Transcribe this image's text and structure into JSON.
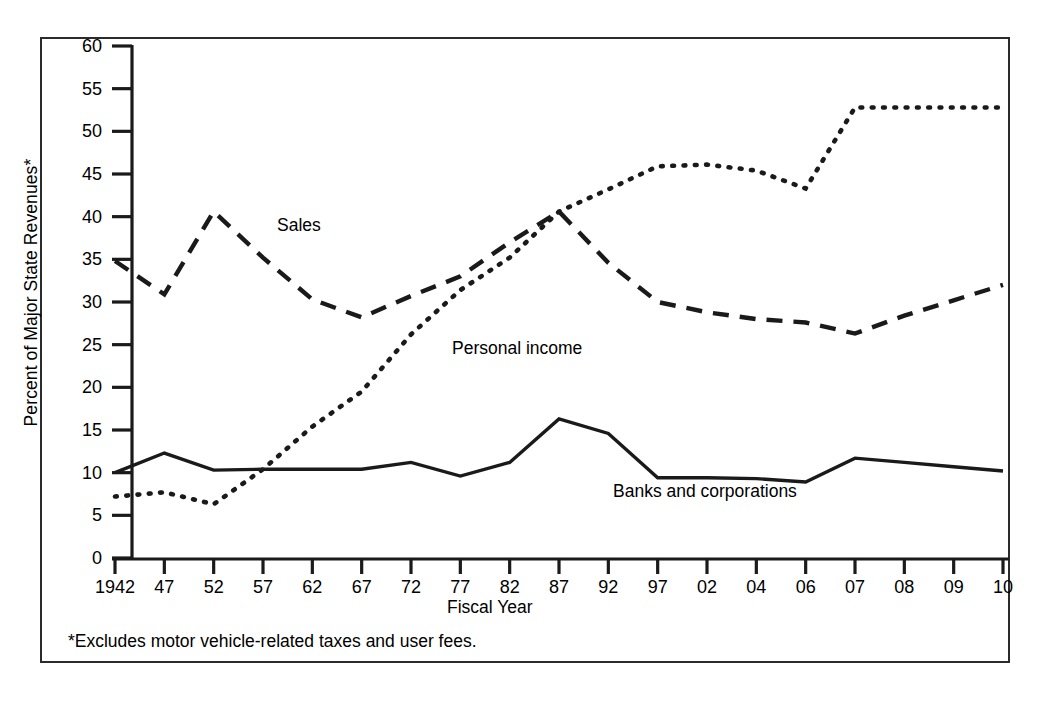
{
  "figure": {
    "y_axis_title": "Percent of Major State Revenues*",
    "x_axis_title": "Fiscal Year",
    "footnote": "*Excludes motor vehicle-related taxes and user fees.",
    "line_color": "#1a1a1a",
    "border_color": "#2b2b2b",
    "background": "#ffffff"
  },
  "chart_data": {
    "type": "line",
    "title": "",
    "xlabel": "Fiscal Year",
    "ylabel": "Percent of Major State Revenues*",
    "ylim": [
      0,
      60
    ],
    "yticks": [
      0,
      5,
      10,
      15,
      20,
      25,
      30,
      35,
      40,
      45,
      50,
      55,
      60
    ],
    "grid": false,
    "legend_position": "inline-annotations",
    "annotation": "*Excludes motor vehicle-related taxes and user fees.",
    "categories": [
      "1942",
      "47",
      "52",
      "57",
      "62",
      "67",
      "72",
      "77",
      "82",
      "87",
      "92",
      "97",
      "02",
      "04",
      "06",
      "07",
      "08",
      "09",
      "10"
    ],
    "series": [
      {
        "name": "Sales",
        "style": "dashed",
        "values": [
          34.8,
          30.9,
          40.6,
          35.2,
          30.3,
          28.2,
          30.7,
          33.0,
          37.0,
          40.6,
          34.6,
          30.0,
          28.8,
          28.0,
          27.6,
          26.3,
          28.4,
          30.2,
          32.0
        ]
      },
      {
        "name": "Personal income",
        "style": "dotted",
        "values": [
          7.2,
          7.7,
          6.3,
          10.4,
          15.4,
          19.5,
          26.2,
          31.4,
          35.2,
          40.6,
          43.2,
          45.9,
          46.1,
          45.4,
          43.3,
          52.8,
          52.8,
          52.8,
          52.8
        ]
      },
      {
        "name": "Banks and corporations",
        "style": "solid",
        "values": [
          10.0,
          12.3,
          10.3,
          10.4,
          10.4,
          10.4,
          11.2,
          9.6,
          11.2,
          16.3,
          14.6,
          9.4,
          9.4,
          9.3,
          8.9,
          11.7,
          11.2,
          10.7,
          10.2
        ]
      }
    ]
  }
}
